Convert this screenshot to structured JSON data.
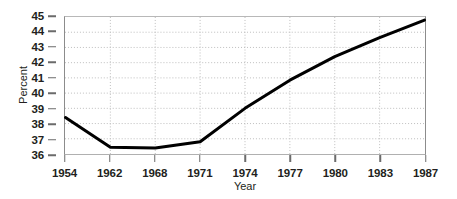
{
  "chart_data": {
    "type": "line",
    "title": "",
    "xlabel": "Year",
    "ylabel": "Percent",
    "categories": [
      "1954",
      "1962",
      "1968",
      "1971",
      "1974",
      "1977",
      "1980",
      "1983",
      "1987"
    ],
    "x": [
      1954,
      1962,
      1968,
      1971,
      1974,
      1977,
      1980,
      1983,
      1987
    ],
    "values": [
      38.4,
      36.45,
      36.4,
      36.8,
      39.0,
      40.85,
      42.4,
      43.65,
      44.8
    ],
    "series": [
      {
        "name": "Percent",
        "values": [
          38.4,
          36.45,
          36.4,
          36.8,
          39.0,
          40.85,
          42.4,
          43.65,
          44.8
        ],
        "color": "#000000"
      }
    ],
    "ylim": [
      36,
      45
    ],
    "yticks": [
      36,
      37,
      38,
      39,
      40,
      41,
      42,
      43,
      44,
      45
    ],
    "ytick_labels": [
      "36",
      "37",
      "38",
      "39",
      "40",
      "41",
      "42",
      "43",
      "44",
      "45"
    ],
    "xtick_labels": [
      "1954",
      "1962",
      "1968",
      "1971",
      "1974",
      "1977",
      "1980",
      "1983",
      "1987"
    ],
    "grid": true,
    "grid_style": "dotted",
    "grid_color": "#bdbdbd",
    "legend": "none",
    "line_width": 3,
    "line_color": "#000000",
    "axis_color": "#8c8c8c",
    "background": "#ffffff"
  }
}
